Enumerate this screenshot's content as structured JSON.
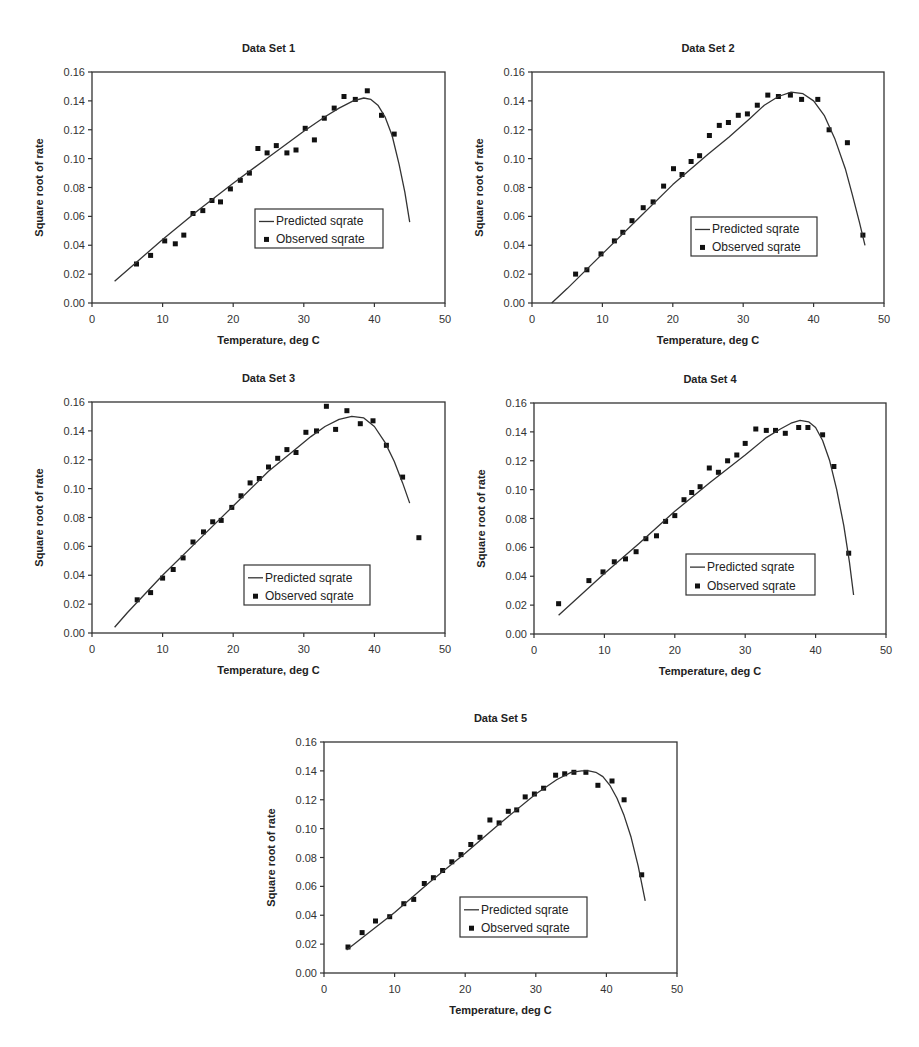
{
  "figure": {
    "legend": {
      "predicted_label": "Predicted sqrate",
      "observed_label": "Observed sqrate"
    },
    "xlabel": "Temperature, deg C",
    "ylabel": "Square root of rate"
  },
  "chart_data": [
    {
      "type": "scatter",
      "title": "Data Set 1",
      "xlabel": "Temperature, deg C",
      "ylabel": "Square root of rate",
      "xlim": [
        0,
        50
      ],
      "ylim": [
        0,
        0.16
      ],
      "xticks": [
        "0",
        "10",
        "20",
        "30",
        "40",
        "50"
      ],
      "yticks": [
        "0.00",
        "0.02",
        "0.04",
        "0.06",
        "0.08",
        "0.10",
        "0.12",
        "0.14",
        "0.16"
      ],
      "legend_position": "center-right",
      "series": [
        {
          "name": "Observed sqrate",
          "kind": "markers",
          "x": [
            6.3,
            8.3,
            10.3,
            11.8,
            13.0,
            14.3,
            15.7,
            17.0,
            18.2,
            19.6,
            21.0,
            22.3,
            23.5,
            24.8,
            26.1,
            27.6,
            28.9,
            30.2,
            31.5,
            32.9,
            34.3,
            35.7,
            37.3,
            39.0,
            41.0,
            42.8
          ],
          "y": [
            0.027,
            0.033,
            0.043,
            0.041,
            0.047,
            0.062,
            0.064,
            0.071,
            0.07,
            0.079,
            0.085,
            0.09,
            0.107,
            0.104,
            0.109,
            0.104,
            0.106,
            0.121,
            0.113,
            0.128,
            0.135,
            0.143,
            0.141,
            0.147,
            0.13,
            0.117
          ]
        },
        {
          "name": "Predicted sqrate",
          "kind": "line",
          "x": [
            3.2,
            10,
            15,
            20,
            25,
            30,
            33,
            35,
            37,
            38.5,
            39.5,
            40.5,
            41.5,
            42.5,
            43.5,
            44.3,
            45.0
          ],
          "y": [
            0.015,
            0.044,
            0.064,
            0.083,
            0.101,
            0.119,
            0.129,
            0.135,
            0.14,
            0.142,
            0.141,
            0.137,
            0.129,
            0.116,
            0.096,
            0.077,
            0.056
          ]
        }
      ],
      "layout": {
        "left": 0,
        "top": 0,
        "width": 460,
        "height": 355,
        "plot": {
          "x0": 92,
          "x1": 445,
          "y0": 72,
          "y1": 303
        },
        "legend_box": {
          "x": 255,
          "y": 209,
          "w": 128,
          "h": 39
        }
      }
    },
    {
      "type": "scatter",
      "title": "Data Set 2",
      "xlabel": "Temperature, deg C",
      "ylabel": "Square root of rate",
      "xlim": [
        0,
        50
      ],
      "ylim": [
        0,
        0.16
      ],
      "xticks": [
        "0",
        "10",
        "20",
        "30",
        "40",
        "50"
      ],
      "yticks": [
        "0.00",
        "0.02",
        "0.04",
        "0.06",
        "0.08",
        "0.10",
        "0.12",
        "0.14",
        "0.16"
      ],
      "legend_position": "center-right",
      "series": [
        {
          "name": "Observed sqrate",
          "kind": "markers",
          "x": [
            6.2,
            7.8,
            9.8,
            11.7,
            12.9,
            14.2,
            15.8,
            17.2,
            18.7,
            20.1,
            21.3,
            22.6,
            23.8,
            25.2,
            26.6,
            27.9,
            29.3,
            30.6,
            32.0,
            33.5,
            35.0,
            36.7,
            38.3,
            40.6,
            42.2,
            44.8,
            47.0
          ],
          "y": [
            0.02,
            0.023,
            0.034,
            0.043,
            0.049,
            0.057,
            0.066,
            0.07,
            0.081,
            0.093,
            0.089,
            0.098,
            0.102,
            0.116,
            0.123,
            0.125,
            0.13,
            0.131,
            0.137,
            0.144,
            0.143,
            0.144,
            0.141,
            0.141,
            0.12,
            0.111,
            0.047
          ]
        },
        {
          "name": "Predicted sqrate",
          "kind": "line",
          "x": [
            2.8,
            5,
            10,
            15,
            20,
            25,
            28,
            31,
            33,
            35,
            36.8,
            38.5,
            40,
            41.5,
            43,
            44.5,
            45.5,
            46.5,
            47.3
          ],
          "y": [
            0.0,
            0.01,
            0.034,
            0.058,
            0.082,
            0.103,
            0.115,
            0.128,
            0.137,
            0.143,
            0.146,
            0.145,
            0.14,
            0.13,
            0.114,
            0.093,
            0.075,
            0.056,
            0.04
          ]
        }
      ],
      "layout": {
        "left": 460,
        "top": 0,
        "width": 459,
        "height": 355,
        "plot": {
          "x0": 72,
          "x1": 424,
          "y0": 72,
          "y1": 303
        },
        "legend_box": {
          "x": 231,
          "y": 217,
          "w": 126,
          "h": 39
        }
      }
    },
    {
      "type": "scatter",
      "title": "Data Set 3",
      "xlabel": "Temperature, deg C",
      "ylabel": "Square root of rate",
      "xlim": [
        0,
        50
      ],
      "ylim": [
        0,
        0.16
      ],
      "xticks": [
        "0",
        "10",
        "20",
        "30",
        "40",
        "50"
      ],
      "yticks": [
        "0.00",
        "0.02",
        "0.04",
        "0.06",
        "0.08",
        "0.10",
        "0.12",
        "0.14",
        "0.16"
      ],
      "legend_position": "center-right",
      "series": [
        {
          "name": "Observed sqrate",
          "kind": "markers",
          "x": [
            6.4,
            8.3,
            10.0,
            11.5,
            12.9,
            14.3,
            15.8,
            17.1,
            18.3,
            19.8,
            21.1,
            22.4,
            23.7,
            25.0,
            26.3,
            27.6,
            28.9,
            30.3,
            31.8,
            33.2,
            34.5,
            36.1,
            38.0,
            39.8,
            41.7,
            44.0,
            46.3
          ],
          "y": [
            0.023,
            0.028,
            0.038,
            0.044,
            0.052,
            0.063,
            0.07,
            0.077,
            0.078,
            0.087,
            0.095,
            0.104,
            0.107,
            0.115,
            0.121,
            0.127,
            0.125,
            0.139,
            0.14,
            0.157,
            0.141,
            0.154,
            0.145,
            0.147,
            0.13,
            0.108,
            0.066
          ]
        },
        {
          "name": "Predicted sqrate",
          "kind": "line",
          "x": [
            3.2,
            5,
            10,
            15,
            20,
            25,
            28,
            31,
            33,
            35,
            36.8,
            38.5,
            40,
            41.5,
            42.8,
            44.0,
            45.0
          ],
          "y": [
            0.004,
            0.014,
            0.04,
            0.064,
            0.088,
            0.112,
            0.124,
            0.136,
            0.143,
            0.148,
            0.15,
            0.149,
            0.143,
            0.132,
            0.119,
            0.104,
            0.09
          ]
        }
      ],
      "layout": {
        "left": 0,
        "top": 358,
        "width": 460,
        "height": 345,
        "plot": {
          "x0": 92,
          "x1": 445,
          "y0": 44,
          "y1": 275
        },
        "legend_box": {
          "x": 244,
          "y": 207,
          "w": 126,
          "h": 40
        }
      }
    },
    {
      "type": "scatter",
      "title": "Data Set 4",
      "xlabel": "Temperature, deg C",
      "ylabel": "Square root of rate",
      "xlim": [
        0,
        50
      ],
      "ylim": [
        0,
        0.16
      ],
      "xticks": [
        "0",
        "10",
        "20",
        "30",
        "40",
        "50"
      ],
      "yticks": [
        "0.00",
        "0.02",
        "0.04",
        "0.06",
        "0.08",
        "0.10",
        "0.12",
        "0.14",
        "0.16"
      ],
      "legend_position": "center-right",
      "series": [
        {
          "name": "Observed sqrate",
          "kind": "markers",
          "x": [
            3.5,
            7.8,
            9.8,
            11.4,
            13.0,
            14.5,
            15.9,
            17.4,
            18.7,
            20.0,
            21.3,
            22.4,
            23.6,
            24.9,
            26.2,
            27.5,
            28.8,
            30.0,
            31.5,
            33.0,
            34.3,
            35.7,
            37.6,
            38.9,
            41.0,
            42.6,
            44.7
          ],
          "y": [
            0.021,
            0.037,
            0.043,
            0.05,
            0.052,
            0.057,
            0.066,
            0.068,
            0.078,
            0.082,
            0.093,
            0.098,
            0.102,
            0.115,
            0.112,
            0.12,
            0.124,
            0.132,
            0.142,
            0.141,
            0.141,
            0.139,
            0.143,
            0.143,
            0.138,
            0.116,
            0.056
          ]
        },
        {
          "name": "Predicted sqrate",
          "kind": "line",
          "x": [
            3.5,
            10,
            15,
            20,
            25,
            30,
            33,
            35,
            36.5,
            37.8,
            39,
            40,
            41,
            42,
            43,
            44,
            44.8,
            45.4
          ],
          "y": [
            0.013,
            0.042,
            0.063,
            0.085,
            0.105,
            0.124,
            0.136,
            0.142,
            0.146,
            0.148,
            0.147,
            0.143,
            0.134,
            0.12,
            0.1,
            0.075,
            0.05,
            0.027
          ]
        }
      ],
      "layout": {
        "left": 460,
        "top": 358,
        "width": 459,
        "height": 345,
        "plot": {
          "x0": 74,
          "x1": 426,
          "y0": 45,
          "y1": 276
        },
        "legend_box": {
          "x": 226,
          "y": 196,
          "w": 129,
          "h": 41
        }
      }
    },
    {
      "type": "scatter",
      "title": "Data Set 5",
      "xlabel": "Temperature, deg C",
      "ylabel": "Square root of rate",
      "xlim": [
        0,
        50
      ],
      "ylim": [
        0,
        0.16
      ],
      "xticks": [
        "0",
        "10",
        "20",
        "30",
        "40",
        "50"
      ],
      "yticks": [
        "0.00",
        "0.02",
        "0.04",
        "0.06",
        "0.08",
        "0.10",
        "0.12",
        "0.14",
        "0.16"
      ],
      "legend_position": "center-right",
      "series": [
        {
          "name": "Observed sqrate",
          "kind": "markers",
          "x": [
            3.4,
            5.4,
            7.3,
            9.3,
            11.3,
            12.7,
            14.2,
            15.5,
            16.8,
            18.1,
            19.4,
            20.8,
            22.1,
            23.5,
            24.8,
            26.1,
            27.3,
            28.5,
            29.8,
            31.1,
            32.8,
            34.1,
            35.4,
            37.1,
            38.8,
            40.8,
            42.5,
            45.0
          ],
          "y": [
            0.018,
            0.028,
            0.036,
            0.039,
            0.048,
            0.051,
            0.062,
            0.066,
            0.071,
            0.077,
            0.082,
            0.089,
            0.094,
            0.106,
            0.104,
            0.112,
            0.113,
            0.122,
            0.124,
            0.128,
            0.137,
            0.138,
            0.139,
            0.139,
            0.13,
            0.133,
            0.12,
            0.068
          ]
        },
        {
          "name": "Predicted sqrate",
          "kind": "line",
          "x": [
            3.2,
            10,
            15,
            20,
            25,
            30,
            33,
            35,
            36.5,
            37.5,
            38.5,
            39.5,
            40.5,
            41.5,
            42.5,
            43.5,
            44.5,
            45.5
          ],
          "y": [
            0.016,
            0.042,
            0.063,
            0.083,
            0.104,
            0.124,
            0.134,
            0.139,
            0.14,
            0.14,
            0.139,
            0.136,
            0.13,
            0.121,
            0.109,
            0.094,
            0.074,
            0.05
          ]
        }
      ],
      "layout": {
        "left": 230,
        "top": 710,
        "width": 470,
        "height": 337,
        "plot": {
          "x0": 94,
          "x1": 447,
          "y0": 32,
          "y1": 263
        },
        "legend_box": {
          "x": 230,
          "y": 187,
          "w": 127,
          "h": 40
        }
      }
    }
  ]
}
